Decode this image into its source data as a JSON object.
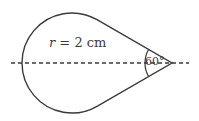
{
  "figure": {
    "radius_label_var": "r",
    "radius_label_rest": " = 2 cm",
    "angle_label": "60°",
    "shape": "teardrop: circle with two tangent lines meeting at a point",
    "stroke_color": "#3a3a3a",
    "axis_style": "dashed horizontal line through center and tip"
  }
}
